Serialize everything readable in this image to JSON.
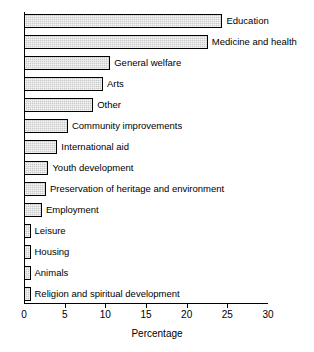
{
  "chart_data": {
    "type": "bar",
    "orientation": "horizontal",
    "title": "",
    "xlabel": "Percentage",
    "ylabel": "",
    "xlim": [
      0,
      30
    ],
    "xticks": [
      0,
      5,
      10,
      15,
      20,
      25,
      30
    ],
    "grid": false,
    "legend": null,
    "categories": [
      "Education",
      "Medicine and health",
      "General welfare",
      "Arts",
      "Other",
      "Community improvements",
      "International aid",
      "Youth development",
      "Preservation of heritage and environment",
      "Employment",
      "Leisure",
      "Housing",
      "Animals",
      "Religion and spiritual development"
    ],
    "values": [
      24.4,
      22.6,
      10.6,
      9.7,
      8.5,
      5.4,
      4.1,
      3.0,
      2.7,
      2.2,
      0.8,
      0.8,
      0.8,
      0.8
    ]
  },
  "style": {
    "bar_fill": "#c9c9c9",
    "bar_border": "#000000",
    "axis_color": "#000000",
    "background": "#ffffff"
  }
}
